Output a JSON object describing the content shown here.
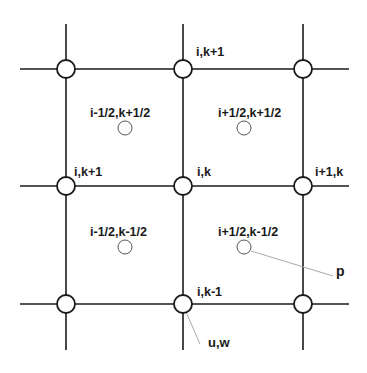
{
  "diagram": {
    "type": "staggered-grid",
    "colors": {
      "line": "#1a1a1a",
      "leader": "#aaaaaa",
      "background": "#ffffff"
    },
    "grid": {
      "x_lines": [
        66,
        183,
        303
      ],
      "y_lines": [
        69,
        186,
        304
      ],
      "extent": {
        "x_min": 20,
        "x_max": 349,
        "y_min": 24,
        "y_max": 350
      }
    },
    "node_radius": 9,
    "cell_center_radius": 7,
    "nodes": [
      {
        "x": 66,
        "y": 69
      },
      {
        "x": 183,
        "y": 69
      },
      {
        "x": 303,
        "y": 69
      },
      {
        "x": 66,
        "y": 186
      },
      {
        "x": 183,
        "y": 186
      },
      {
        "x": 303,
        "y": 186
      },
      {
        "x": 66,
        "y": 304
      },
      {
        "x": 183,
        "y": 304
      },
      {
        "x": 303,
        "y": 304
      }
    ],
    "cell_centers": [
      {
        "x": 125,
        "y": 128
      },
      {
        "x": 244,
        "y": 128
      },
      {
        "x": 125,
        "y": 247
      },
      {
        "x": 244,
        "y": 247
      }
    ],
    "labels": {
      "top_center": "i,k+1",
      "left_mid": "i,k+1",
      "center": "i,k",
      "right_mid": "i+1,k",
      "bottom_center": "i,k-1",
      "cell_tl": "i-1/2,k+1/2",
      "cell_tr": "i+1/2,k+1/2",
      "cell_bl": "i-1/2,k-1/2",
      "cell_br": "i+1/2,k-1/2",
      "pressure": "p",
      "velocity": "u,w"
    }
  }
}
